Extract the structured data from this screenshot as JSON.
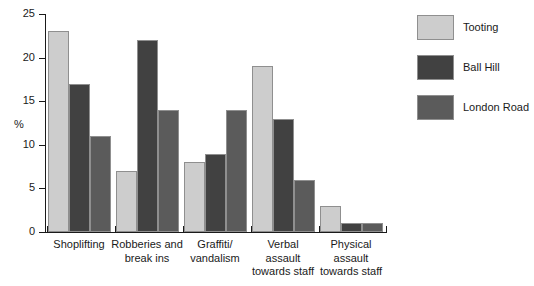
{
  "chart_data": {
    "type": "bar",
    "title": "",
    "xlabel": "",
    "ylabel": "%",
    "ylim": [
      0,
      25
    ],
    "yticks": [
      0,
      5,
      10,
      15,
      20,
      25
    ],
    "grid": false,
    "legend_position": "right",
    "categories": [
      "Shoplifting",
      "Robberies and break ins",
      "Graffiti/ vandalism",
      "Verbal assault towards staff",
      "Physical assault towards staff"
    ],
    "category_lines": [
      [
        "Shoplifting"
      ],
      [
        "Robberies and",
        "break ins"
      ],
      [
        "Graffiti/",
        "vandalism"
      ],
      [
        "Verbal",
        "assault",
        "towards staff"
      ],
      [
        "Physical",
        "assault",
        "towards staff"
      ]
    ],
    "series": [
      {
        "name": "Tooting",
        "color": "#cdcdcd",
        "values": [
          23,
          7,
          8,
          19,
          3
        ]
      },
      {
        "name": "Ball Hill",
        "color": "#414141",
        "values": [
          17,
          22,
          9,
          13,
          1
        ]
      },
      {
        "name": "London Road",
        "color": "#5b5b5b",
        "values": [
          11,
          14,
          14,
          6,
          1
        ]
      }
    ]
  },
  "axis": {
    "y_title": "%",
    "y_tick_labels": [
      "0",
      "5",
      "10",
      "15",
      "20",
      "25"
    ]
  },
  "legend": {
    "items": [
      {
        "label": "Tooting"
      },
      {
        "label": "Ball Hill"
      },
      {
        "label": "London Road"
      }
    ]
  }
}
